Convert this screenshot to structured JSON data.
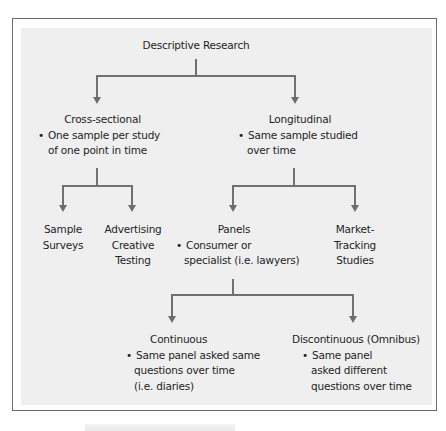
{
  "diagram": {
    "root": {
      "label": "Descriptive Research"
    },
    "cross_sectional": {
      "label": "Cross-sectional",
      "bullet": "One sample per study",
      "bullet_cont": "of one point in time"
    },
    "longitudinal": {
      "label": "Longitudinal",
      "bullet": "Same sample studied",
      "bullet_cont": "over time"
    },
    "sample_surveys": {
      "line1": "Sample",
      "line2": "Surveys"
    },
    "advertising": {
      "line1": "Advertising",
      "line2": "Creative",
      "line3": "Testing"
    },
    "panels": {
      "label": "Panels",
      "bullet": "Consumer or",
      "bullet_cont": "specialist (i.e. lawyers)"
    },
    "market_tracking": {
      "line1": "Market-",
      "line2": "Tracking",
      "line3": "Studies"
    },
    "continuous": {
      "label": "Continuous",
      "bullet": "Same panel asked same",
      "bullet_cont1": "questions over time",
      "bullet_cont2": "(i.e. diaries)"
    },
    "discontinuous": {
      "label": "Discontinuous (Omnibus)",
      "bullet": "Same panel",
      "bullet_cont1": "asked different",
      "bullet_cont2": "questions over time"
    }
  },
  "colors": {
    "background": "#efefef",
    "border": "#6a6a6a",
    "connector": "#707070",
    "text": "#1e1e1e"
  }
}
